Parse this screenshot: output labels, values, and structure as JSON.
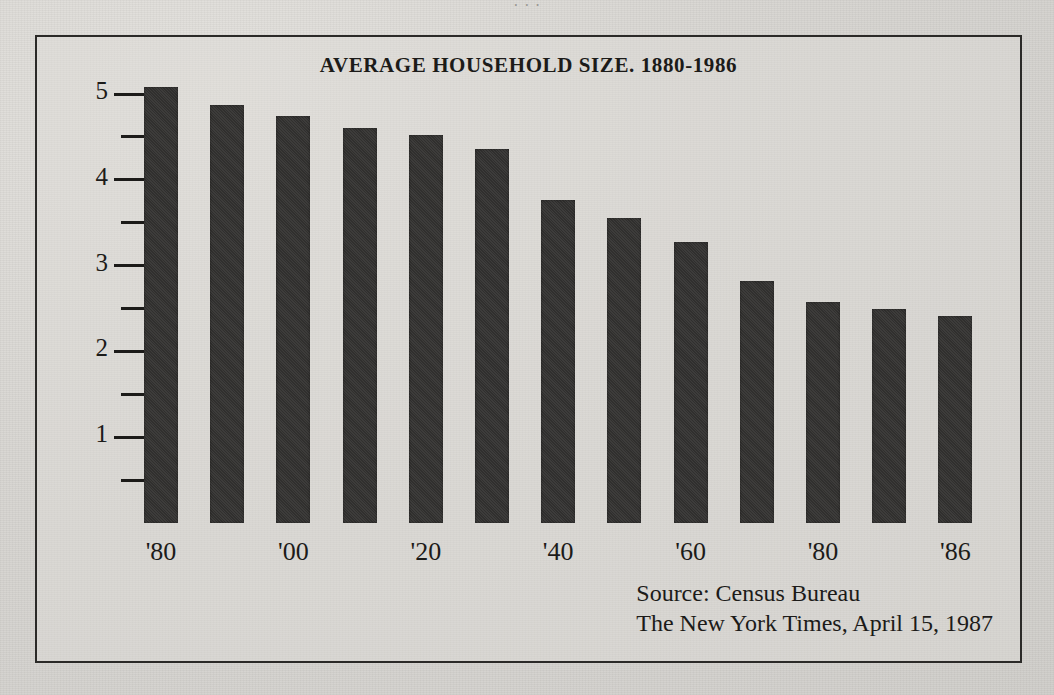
{
  "page": {
    "background_color": "#d9d7d3",
    "frame_color": "#2b2a28",
    "ink_color": "#1c1b19",
    "bar_color": "#333230",
    "bleed_top_text": "· · ·"
  },
  "chart_data": {
    "type": "bar",
    "title": "AVERAGE HOUSEHOLD SIZE. 1880-1986",
    "xlabel": "",
    "ylabel": "",
    "ylim": [
      0,
      5.3
    ],
    "grid": false,
    "legend": null,
    "categories": [
      "1880",
      "1890",
      "1900",
      "1910",
      "1920",
      "1930",
      "1940",
      "1950",
      "1960",
      "1970",
      "1980",
      "1985",
      "1986"
    ],
    "tick_labels": [
      "'80",
      "",
      "'00",
      "",
      "'20",
      "",
      "'40",
      "",
      "'60",
      "",
      "'80",
      "",
      "'86"
    ],
    "values": [
      5.08,
      4.87,
      4.74,
      4.6,
      4.52,
      4.36,
      3.77,
      3.55,
      3.28,
      2.82,
      2.57,
      2.49,
      2.41
    ],
    "y_major_ticks": [
      1,
      2,
      3,
      4,
      5
    ],
    "y_major_tick_labels": [
      "1",
      "2",
      "3",
      "4",
      "5"
    ],
    "y_minor_ticks": [
      0.5,
      1.5,
      2.5,
      3.5,
      4.5
    ],
    "units": "persons per household"
  },
  "source": {
    "line1": "Source: Census Bureau",
    "line2": "The New York Times, April 15, 1987"
  }
}
